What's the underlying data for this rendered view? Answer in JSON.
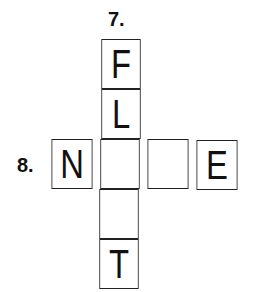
{
  "puzzle": {
    "clues": [
      {
        "number": "7.",
        "direction": "down"
      },
      {
        "number": "8.",
        "direction": "across"
      }
    ],
    "cells": [
      {
        "id": "r0c1",
        "letter": "F"
      },
      {
        "id": "r1c1",
        "letter": "L"
      },
      {
        "id": "r2c0",
        "letter": "N"
      },
      {
        "id": "r2c1",
        "letter": ""
      },
      {
        "id": "r2c2",
        "letter": ""
      },
      {
        "id": "r2c3",
        "letter": "E"
      },
      {
        "id": "r3c1",
        "letter": ""
      },
      {
        "id": "r4c1",
        "letter": "T"
      }
    ]
  }
}
